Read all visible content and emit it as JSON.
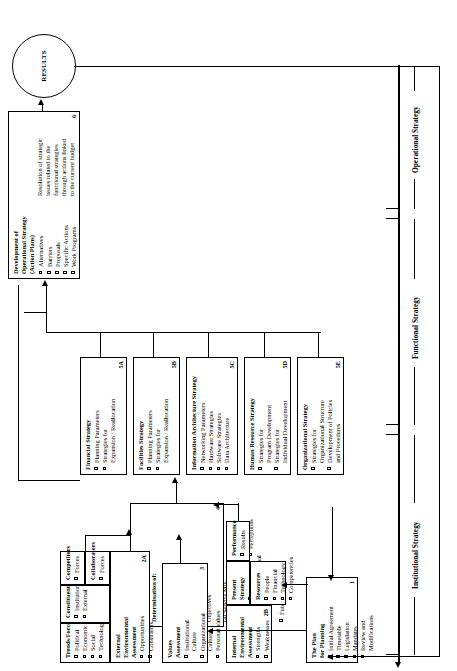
{
  "diagram": {
    "results_node": {
      "label": "RESULTS"
    },
    "bands": [
      {
        "id": "operational",
        "label": "Operational Strategy"
      },
      {
        "id": "functional",
        "label": "Functional Strategy"
      },
      {
        "id": "institutional",
        "label": "Institutional Strategy"
      }
    ],
    "boxes": {
      "plan_for_planning": {
        "number": "1",
        "header": "The Plan\nfor Planning",
        "items": [
          "Initial Agreement",
          "Timetable",
          "Legislation",
          "Mandates",
          "Review and\nModifications"
        ]
      },
      "trends_forces": {
        "header": "Trends/Forces",
        "items": [
          "Political",
          "Economic",
          "Social",
          "Technological"
        ]
      },
      "constituents": {
        "header": "Constituents",
        "items": [
          "Institution",
          "External"
        ]
      },
      "competitors": {
        "header": "Competitors",
        "items": [
          "Forces"
        ]
      },
      "collaborators": {
        "header": "Collaborators",
        "items": [
          "Forces"
        ]
      },
      "external_assessment": {
        "number": "2A",
        "header": "External\nEnvironmental\nAssessment",
        "items": [
          "Opportunities",
          "Constraints"
        ]
      },
      "values_assessment": {
        "number": "3",
        "header": "Values\nAssessment",
        "items": [
          "Institutional\nCulture",
          "Organizational\nCulture",
          "Personal Values"
        ]
      },
      "internal_assessment": {
        "number": "2B",
        "header": "Internal\nEnvironmental\nAssessment",
        "items": [
          "Strengths",
          "Weaknesses"
        ]
      },
      "present_strategy": {
        "header": "Present\nStrategy",
        "items": [
          "Institutional",
          "Organizational"
        ]
      },
      "performance": {
        "header": "Performance",
        "items": [
          "Results",
          "Perceptions"
        ]
      },
      "resources": {
        "header": "Resources",
        "items": [
          "People",
          "Financial",
          "Technology",
          "Competencies"
        ]
      },
      "matching_process": {
        "number": "4",
        "header": "The Matching Process\nResulting in the\nDetermination of:",
        "numbered_items": [
          "(1)  Mission",
          "(2)  Clientele",
          "(3)  Goals &\n      Objectives",
          "(4)  Service Mix",
          "(5)  Service Area",
          "(6)  Comparative\n      Advantage"
        ],
        "items": [
          "Future Scenario"
        ]
      },
      "financial_strategy": {
        "number": "5A",
        "header": "Financial Strategy",
        "items": [
          "Planning Parameters",
          "Strategies for\nExpansion / Reallocation"
        ]
      },
      "facilities_strategy": {
        "number": "5B",
        "header": "Facilities Strategy",
        "items": [
          "Planning Parameters",
          "Strategies for\nExpansion / Reallocation"
        ]
      },
      "information_architecture_strategy": {
        "number": "5C",
        "header": "Information Architecture Strategy",
        "items": [
          "Networking Parameters",
          "Hardware Strategies",
          "Software Strategies",
          "Data Architecture"
        ]
      },
      "human_resource_strategy": {
        "number": "5D",
        "header": "Human Resource Strategy",
        "items": [
          "Strategies for\nProgram Development",
          "Strategies for\nIndividual Development"
        ]
      },
      "organizational_strategy": {
        "number": "5E",
        "header": "Organizational Strategy",
        "items": [
          "Strategies for\nOrganizational Structure",
          "Development of Policies\nand Procedures"
        ]
      },
      "operational_strategy": {
        "number": "6",
        "header": "Development of\nOperational Strategy\n(Action Plans)",
        "items": [
          "Alternatives",
          "Barriers",
          "Proposals",
          "Specific Actions",
          "Work Programs"
        ],
        "note": "Resolution of strategic\nissues related to the\nfunctional strategies\nthrough actions linked\nto the current budget"
      }
    }
  }
}
